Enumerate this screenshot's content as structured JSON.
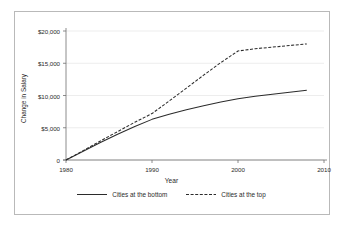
{
  "chart_data": {
    "type": "line",
    "title": "",
    "xlabel": "Year",
    "ylabel": "Change in Salary",
    "xlim": [
      1980,
      2010
    ],
    "ylim": [
      0,
      20000
    ],
    "grid": true,
    "grid_axis": "y",
    "legend_position": "bottom",
    "xticks": [
      1980,
      1990,
      2000,
      2010
    ],
    "xtick_labels": [
      "1980",
      "1990",
      "2000",
      "2010"
    ],
    "yticks": [
      0,
      5000,
      10000,
      15000,
      20000
    ],
    "ytick_labels": [
      "0",
      "$5,000",
      "$10,000",
      "$15,000",
      "$20,000"
    ],
    "series": [
      {
        "name": "Cities at the bottom",
        "style": "solid",
        "color": "#2b2b2b",
        "x": [
          1980,
          1982,
          1984,
          1986,
          1988,
          1990,
          1992,
          1994,
          1996,
          1998,
          2000,
          2002,
          2004,
          2006,
          2008
        ],
        "values": [
          0,
          1350,
          2700,
          4000,
          5200,
          6300,
          7100,
          7800,
          8400,
          9000,
          9500,
          9900,
          10200,
          10500,
          10800
        ]
      },
      {
        "name": "Cities at the top",
        "style": "dashed",
        "color": "#2b2b2b",
        "x": [
          1980,
          1982,
          1984,
          1986,
          1988,
          1990,
          1992,
          1994,
          1996,
          1998,
          2000,
          2002,
          2004,
          2006,
          2008
        ],
        "values": [
          0,
          1450,
          2950,
          4400,
          5850,
          7200,
          9150,
          11150,
          13150,
          15100,
          16900,
          17250,
          17500,
          17750,
          18000
        ]
      }
    ]
  },
  "legend": {
    "entries": [
      {
        "label": "Cities at the bottom",
        "style": "solid"
      },
      {
        "label": "Cities at the top",
        "style": "dashed"
      }
    ]
  },
  "colors": {
    "line": "#2b2b2b",
    "grid": "#e8e8e8",
    "axis": "#6f6f6f",
    "frame": "#b9b9b9",
    "background": "#ffffff"
  }
}
